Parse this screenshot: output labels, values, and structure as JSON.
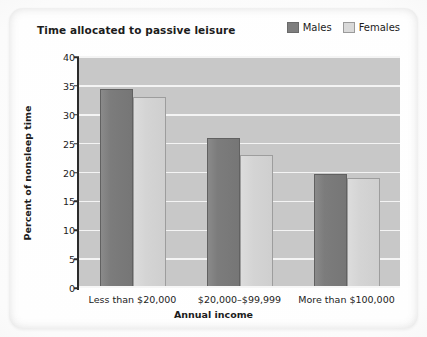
{
  "chart_data": {
    "type": "bar",
    "title": "Time allocated to passive leisure",
    "xlabel": "Annual income",
    "ylabel": "Percent of nonsleep time",
    "categories": [
      "Less than $20,000",
      "$20,000–$99,999",
      "More than $100,000"
    ],
    "series": [
      {
        "name": "Males",
        "values": [
          34.5,
          26.0,
          19.8
        ],
        "color": "#7c7c7c"
      },
      {
        "name": "Females",
        "values": [
          33.0,
          23.0,
          19.0
        ],
        "color": "#d4d4d4"
      }
    ],
    "ylim": [
      0,
      40
    ],
    "ytick_step": 5,
    "yticks": [
      "40",
      "35",
      "30",
      "25",
      "20",
      "15",
      "10",
      "5",
      "0"
    ],
    "grid": true,
    "legend_position": "top-right",
    "plot_background": "#c8c8c8",
    "gridline_color": "#f4f4f4"
  },
  "legend": {
    "items": [
      {
        "label": "Males",
        "swatch": "males-swatch"
      },
      {
        "label": "Females",
        "swatch": "females-swatch"
      }
    ]
  }
}
